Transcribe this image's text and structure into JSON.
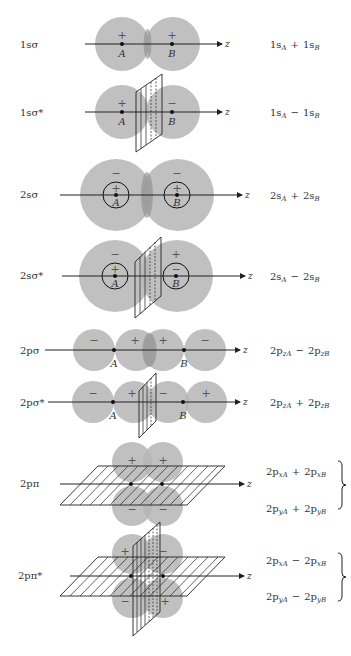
{
  "figure": {
    "rows": [
      {
        "id": "1s-sigma",
        "label": "1sσ",
        "axis_label": "z",
        "lobe_signs": [
          "+",
          "+"
        ],
        "nuclei": [
          "A",
          "B"
        ],
        "combination": {
          "t1": "1s",
          "s1": "A",
          "op": "+",
          "t2": "1s",
          "s2": "B"
        }
      },
      {
        "id": "1s-sigma-star",
        "label": "1sσ*",
        "axis_label": "z",
        "lobe_signs": [
          "+",
          "−"
        ],
        "nuclei": [
          "A",
          "B"
        ],
        "combination": {
          "t1": "1s",
          "s1": "A",
          "op": "−",
          "t2": "1s",
          "s2": "B"
        }
      },
      {
        "id": "2s-sigma",
        "label": "2sσ",
        "axis_label": "z",
        "outer_signs": [
          "−",
          "−"
        ],
        "inner_signs": [
          "+",
          "+"
        ],
        "nuclei": [
          "A",
          "B"
        ],
        "combination": {
          "t1": "2s",
          "s1": "A",
          "op": "+",
          "t2": "2s",
          "s2": "B"
        }
      },
      {
        "id": "2s-sigma-star",
        "label": "2sσ*",
        "axis_label": "z",
        "outer_signs": [
          "−",
          "+"
        ],
        "inner_signs": [
          "+",
          "−"
        ],
        "nuclei": [
          "A",
          "B"
        ],
        "combination": {
          "t1": "2s",
          "s1": "A",
          "op": "−",
          "t2": "2s",
          "s2": "B"
        }
      },
      {
        "id": "2p-sigma",
        "label": "2pσ",
        "axis_label": "z",
        "lobe_signs": [
          "−",
          "+",
          "+",
          "−"
        ],
        "nuclei": [
          "A",
          "B"
        ],
        "combination": {
          "t1": "2p",
          "s1": "zA",
          "op": "−",
          "t2": "2p",
          "s2": "zB"
        }
      },
      {
        "id": "2p-sigma-star",
        "label": "2pσ*",
        "axis_label": "z",
        "lobe_signs": [
          "−",
          "+",
          "−",
          "+"
        ],
        "nuclei": [
          "A",
          "B"
        ],
        "combination": {
          "t1": "2p",
          "s1": "zA",
          "op": "+",
          "t2": "2p",
          "s2": "zB"
        }
      },
      {
        "id": "2p-pi",
        "label": "2pπ",
        "axis_label": "z",
        "lobe_signs": [
          "+",
          "+",
          "−",
          "−"
        ],
        "combinations": [
          {
            "t1": "2p",
            "s1": "xA",
            "op": "+",
            "t2": "2p",
            "s2": "xB"
          },
          {
            "t1": "2p",
            "s1": "yA",
            "op": "+",
            "t2": "2p",
            "s2": "yB"
          }
        ]
      },
      {
        "id": "2p-pi-star",
        "label": "2pπ*",
        "axis_label": "z",
        "lobe_signs": [
          "+",
          "−",
          "−",
          "+"
        ],
        "combinations": [
          {
            "t1": "2p",
            "s1": "xA",
            "op": "−",
            "t2": "2p",
            "s2": "xB"
          },
          {
            "t1": "2p",
            "s1": "yA",
            "op": "−",
            "t2": "2p",
            "s2": "yB"
          }
        ]
      }
    ],
    "colors": {
      "lobe": "#b5b5b5",
      "overlap": "#8e8e8e",
      "line": "#222222",
      "text": "#333333"
    }
  }
}
